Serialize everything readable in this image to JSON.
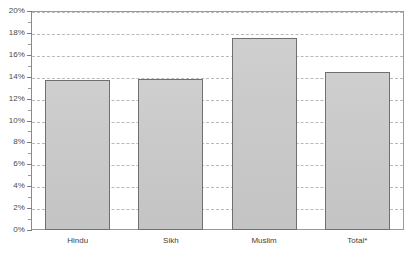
{
  "chart_data": {
    "type": "bar",
    "title": "",
    "subtitle": "",
    "xlabel": "",
    "ylabel": "",
    "categories": [
      "Hindu",
      "Sikh",
      "Muslim",
      "Total*"
    ],
    "values": [
      13.7,
      13.8,
      17.5,
      14.4
    ],
    "value_format": "percent",
    "ylim": [
      0,
      20
    ],
    "ytick_step": 2,
    "yminor_step": 1,
    "ytick_labels": [
      "0%",
      "2%",
      "4%",
      "6%",
      "8%",
      "10%",
      "12%",
      "14%",
      "16%",
      "18%",
      "20%"
    ],
    "ytick_values": [
      0,
      2,
      4,
      6,
      8,
      10,
      12,
      14,
      16,
      18,
      20
    ],
    "grid": true,
    "grid_axis": "y",
    "grid_style": "dashed",
    "legend": false,
    "legend_position": "none",
    "annotations": [],
    "series": [
      {
        "name": "",
        "values": [
          13.7,
          13.8,
          17.5,
          14.4
        ]
      }
    ],
    "colors": {
      "bar_fill": "#c9c9c9",
      "bar_border": "#6f6f6f",
      "gridline": "#b9b9b9",
      "axis": "#8a8a8a",
      "plot_border": "#9a9a9a",
      "text": "#3f3f3f",
      "background": "#ffffff"
    }
  }
}
